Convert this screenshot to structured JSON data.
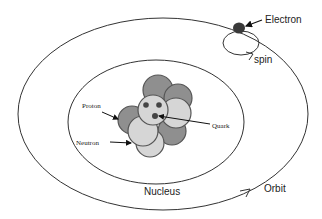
{
  "diagram": {
    "labels": {
      "electron": "Electron",
      "spin": "spin",
      "proton": "Proton",
      "neutron": "Neutron",
      "quark": "Quark",
      "nucleus": "Nucleus",
      "orbit": "Orbit"
    },
    "colors": {
      "proton": "#8f8f8f",
      "neutron": "#d6d6d6",
      "electron": "#3a3a3a",
      "stroke": "#333333"
    }
  }
}
